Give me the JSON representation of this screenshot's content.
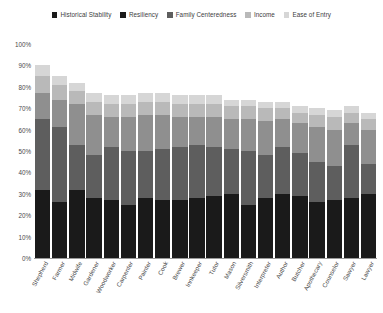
{
  "chart_data": {
    "type": "bar",
    "stacked": true,
    "title": "",
    "xlabel": "",
    "ylabel": "",
    "ylim": [
      0,
      100
    ],
    "y_tick_labels": [
      "100%",
      "90%",
      "80%",
      "70%",
      "60%",
      "50%",
      "40%",
      "30%",
      "20%",
      "10%",
      "0%"
    ],
    "y_ticks": [
      100,
      90,
      80,
      70,
      60,
      50,
      40,
      30,
      20,
      10,
      0
    ],
    "grid": false,
    "legend_position": "top",
    "categories": [
      "Shepherd",
      "Farmer",
      "Midwife",
      "Gardener",
      "Woodworker",
      "Carpenter",
      "Painter",
      "Cook",
      "Brewer",
      "Innkeeper",
      "Tutor",
      "Mason",
      "Silversmith",
      "Interpreter",
      "Author",
      "Butcher",
      "Apothecary",
      "Counselor",
      "Sawyer",
      "Lawyer"
    ],
    "series": [
      {
        "name": "Historical Stability",
        "color": "#1a1a1a",
        "values": [
          32,
          26,
          32,
          28,
          27,
          25,
          28,
          27,
          27,
          28,
          29,
          30,
          25,
          28,
          30,
          29,
          26,
          27,
          28,
          30
        ]
      },
      {
        "name": "Resiliency",
        "color": "#5e5e5e",
        "values": [
          33,
          35,
          21,
          20,
          25,
          25,
          22,
          24,
          25,
          25,
          23,
          21,
          25,
          20,
          22,
          20,
          19,
          16,
          25,
          14
        ]
      },
      {
        "name": "Family Centeredness",
        "color": "#8f8f8f",
        "values": [
          12,
          13,
          19,
          19,
          14,
          16,
          17,
          16,
          14,
          13,
          14,
          14,
          15,
          16,
          13,
          14,
          16,
          17,
          10,
          16
        ]
      },
      {
        "name": "Income",
        "color": "#b9b9b9",
        "values": [
          8,
          7,
          6,
          6,
          6,
          6,
          6,
          6,
          6,
          6,
          6,
          6,
          6,
          6,
          5,
          5,
          6,
          6,
          5,
          5
        ]
      },
      {
        "name": "Ease of Entry",
        "color": "#d6d6d6",
        "values": [
          5,
          4,
          4,
          4,
          4,
          4,
          4,
          4,
          4,
          4,
          4,
          3,
          3,
          3,
          3,
          3,
          3,
          3,
          3,
          3
        ]
      }
    ],
    "totals": [
      90,
      85,
      82,
      77,
      76,
      76,
      77,
      77,
      76,
      76,
      76,
      74,
      74,
      73,
      73,
      71,
      70,
      69,
      71,
      68
    ]
  },
  "legend": {
    "items": [
      {
        "label": "Historical Stability",
        "color": "#1a1a1a"
      },
      {
        "label": "Resiliency",
        "color": "#1a1a1a"
      },
      {
        "label": "Family Centeredness",
        "color": "#5e5e5e"
      },
      {
        "label": "Income",
        "color": "#b9b9b9"
      },
      {
        "label": "Ease of Entry",
        "color": "#d6d6d6"
      }
    ]
  }
}
